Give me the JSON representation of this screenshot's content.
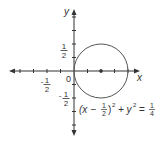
{
  "diagram": {
    "type": "circle-graph",
    "axes": {
      "x_label": "x",
      "y_label": "y",
      "origin_label": "0"
    },
    "tick_labels": {
      "x_neg_half": {
        "num": "1",
        "den": "2",
        "sign": "-"
      },
      "y_pos_half": {
        "num": "1",
        "den": "2"
      },
      "y_neg_half": {
        "num": "1",
        "den": "2",
        "sign": "-"
      }
    },
    "circle": {
      "center": [
        0.5,
        0
      ],
      "radius": 0.5
    },
    "equation": {
      "open": "(x −",
      "frac_num": "1",
      "frac_den": "2",
      "close": ")",
      "sq1": "2",
      "plus_y": "+ y",
      "sq2": "2",
      "equals": "=",
      "rhs_num": "1",
      "rhs_den": "4"
    },
    "colors": {
      "axis": "#333333",
      "circle": "#555555"
    }
  }
}
